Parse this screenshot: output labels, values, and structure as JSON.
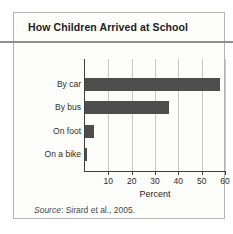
{
  "figure": {
    "source": {
      "prefix": "Source",
      "rest": ": Sirard et al., 2005."
    }
  },
  "chart_data": {
    "type": "bar",
    "orientation": "horizontal",
    "title": "How Children Arrived at School",
    "categories": [
      "By car",
      "By bus",
      "On foot",
      "On a bike"
    ],
    "values": [
      58,
      36,
      4,
      1
    ],
    "xlabel": "Percent",
    "ylabel": "",
    "xlim": [
      0,
      60
    ],
    "xticks": [
      10,
      20,
      30,
      40,
      50,
      60
    ],
    "grid": true,
    "legend": "none",
    "source_note": "Source: Sirard et al., 2005."
  },
  "colors": {
    "bar": "#4d4d4d",
    "axis": "#3f3f3f",
    "gridline": "#c8c8c8",
    "card_border": "#b3b3b3",
    "card_background": "#fdfdfb",
    "title_rule": "#8f8f8f",
    "text": "#1c1c1c",
    "muted_text": "#4a4a4a"
  }
}
